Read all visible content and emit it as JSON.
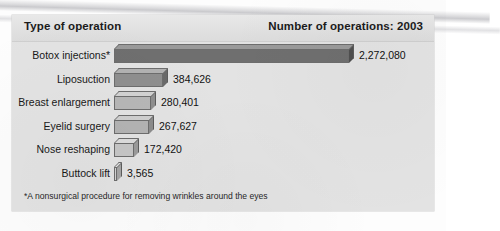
{
  "header": {
    "left_title": "Type of operation",
    "right_title": "Number of operations: 2003"
  },
  "footnote": "*A nonsurgical procedure for removing wrinkles around the eyes",
  "chart_data": {
    "type": "bar",
    "orientation": "horizontal",
    "title": "Number of operations: 2003",
    "xlabel": "",
    "ylabel": "Type of operation",
    "grid": false,
    "legend": false,
    "axis_range": [
      0,
      2272080
    ],
    "categories": [
      "Botox injections*",
      "Liposuction",
      "Breast enlargement",
      "Eyelid surgery",
      "Nose reshaping",
      "Buttock lift"
    ],
    "values": [
      2272080,
      384626,
      280401,
      267627,
      172420,
      3565
    ],
    "value_labels": [
      "2,272,080",
      "384,626",
      "280,401",
      "267,627",
      "172,420",
      "3,565"
    ],
    "bar_colors": [
      "#6f6f6f",
      "#8f8f8f",
      "#b4b4b4",
      "#b0b0b0",
      "#c4c4c4",
      "#cfcfcf"
    ],
    "note": "*A nonsurgical procedure for removing wrinkles around the eyes"
  },
  "rows": [
    {
      "label": "Botox injections*",
      "value_label": "2,272,080",
      "bar_px": 235,
      "front": "#6f6f6f",
      "top": "#9a9a9a",
      "side": "#4f4f4f"
    },
    {
      "label": "Liposuction",
      "value_label": "384,626",
      "bar_px": 49,
      "front": "#8f8f8f",
      "top": "#b2b2b2",
      "side": "#6a6a6a"
    },
    {
      "label": "Breast enlargement",
      "value_label": "280,401",
      "bar_px": 37,
      "front": "#b7b7b7",
      "top": "#d2d2d2",
      "side": "#8f8f8f"
    },
    {
      "label": "Eyelid surgery",
      "value_label": "267,627",
      "bar_px": 35,
      "front": "#b3b3b3",
      "top": "#cfcfcf",
      "side": "#8c8c8c"
    },
    {
      "label": "Nose reshaping",
      "value_label": "172,420",
      "bar_px": 20,
      "front": "#c6c6c6",
      "top": "#dcdcdc",
      "side": "#9b9b9b"
    },
    {
      "label": "Buttock lift",
      "value_label": "3,565",
      "bar_px": 3,
      "front": "#d4d4d4",
      "top": "#e4e4e4",
      "side": "#a6a6a6"
    }
  ]
}
